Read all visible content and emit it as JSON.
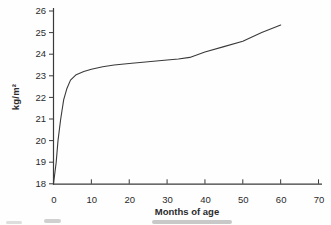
{
  "chart_data": {
    "type": "line",
    "title": "",
    "xlabel": "Months of age",
    "ylabel": "kg/m²",
    "xlim": [
      0,
      70
    ],
    "ylim": [
      18,
      26
    ],
    "x_ticks": [
      0,
      10,
      20,
      30,
      40,
      50,
      60,
      70
    ],
    "y_ticks": [
      18,
      19,
      20,
      21,
      22,
      23,
      24,
      25,
      26
    ],
    "grid": false,
    "legend": "none",
    "series": [
      {
        "name": "curve",
        "points": [
          [
            0,
            18.0
          ],
          [
            0.7,
            19.0
          ],
          [
            1.2,
            20.0
          ],
          [
            1.9,
            21.0
          ],
          [
            2.7,
            21.9
          ],
          [
            3.5,
            22.4
          ],
          [
            4.5,
            22.8
          ],
          [
            6,
            23.05
          ],
          [
            8,
            23.2
          ],
          [
            10,
            23.3
          ],
          [
            13,
            23.42
          ],
          [
            16,
            23.5
          ],
          [
            20,
            23.57
          ],
          [
            25,
            23.65
          ],
          [
            30,
            23.73
          ],
          [
            33,
            23.78
          ],
          [
            36,
            23.85
          ],
          [
            40,
            24.1
          ],
          [
            45,
            24.35
          ],
          [
            50,
            24.6
          ],
          [
            55,
            25.0
          ],
          [
            60,
            25.35
          ]
        ]
      }
    ],
    "colors": {
      "axis": "#3a3a3a",
      "curve": "#3a3a3a",
      "tick_text": "#2b2b2b"
    }
  }
}
